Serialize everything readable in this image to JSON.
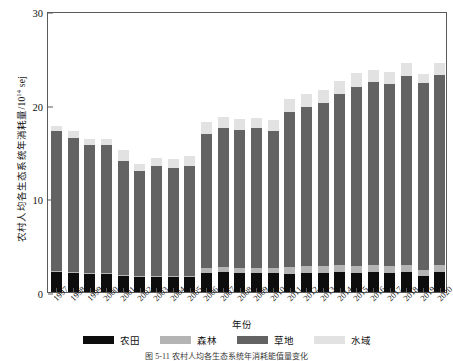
{
  "chart_data": {
    "type": "bar",
    "stacked": true,
    "title": "",
    "xlabel": "年份",
    "ylabel": "农村人均各生态系统年消耗量/10",
    "ylabel_exponent": "14",
    "ylabel_unit": " sej",
    "ylim": [
      0,
      30
    ],
    "yticks": [
      0,
      10,
      20,
      30
    ],
    "grid": false,
    "legend_position": "bottom",
    "categories": [
      "1997",
      "1998",
      "1999",
      "2000",
      "2001",
      "2002",
      "2003",
      "2004",
      "2005",
      "2006",
      "2007",
      "2008",
      "2009",
      "2010",
      "2011",
      "2012",
      "2013",
      "2014",
      "2015",
      "2016",
      "2017",
      "2018",
      "2019",
      "2020"
    ],
    "series": [
      {
        "name": "农田",
        "color": "#0d0d0d",
        "values": [
          2.1,
          2.0,
          1.9,
          1.9,
          1.7,
          1.6,
          1.6,
          1.6,
          1.6,
          2.0,
          2.1,
          2.0,
          2.0,
          2.0,
          1.9,
          2.0,
          2.0,
          2.1,
          2.0,
          2.1,
          2.0,
          2.1,
          1.7,
          2.1
        ]
      },
      {
        "name": "森林",
        "color": "#b4b4b4",
        "values": [
          0.15,
          0.15,
          0.15,
          0.15,
          0.15,
          0.15,
          0.15,
          0.15,
          0.15,
          0.55,
          0.6,
          0.6,
          0.6,
          0.6,
          0.75,
          0.8,
          0.8,
          0.8,
          0.8,
          0.8,
          0.8,
          0.8,
          0.7,
          0.8
        ]
      },
      {
        "name": "草地",
        "color": "#636363",
        "values": [
          14.9,
          14.3,
          13.6,
          13.6,
          12.1,
          11.2,
          11.7,
          11.5,
          11.7,
          14.3,
          14.8,
          14.7,
          14.9,
          14.6,
          16.6,
          17.0,
          17.4,
          18.2,
          19.1,
          19.5,
          19.4,
          20.2,
          19.9,
          20.3
        ]
      },
      {
        "name": "水域",
        "color": "#e2e2e2",
        "values": [
          0.55,
          0.75,
          0.65,
          0.65,
          1.25,
          0.75,
          0.85,
          0.95,
          1.05,
          1.35,
          1.2,
          1.2,
          1.1,
          1.2,
          1.35,
          1.3,
          1.35,
          1.4,
          1.45,
          1.3,
          1.3,
          1.35,
          0.95,
          1.3
        ]
      }
    ],
    "totals": [
      17.7,
      17.2,
      16.3,
      16.3,
      15.2,
      13.7,
      14.3,
      14.2,
      14.5,
      18.2,
      18.7,
      18.5,
      18.6,
      18.4,
      20.6,
      21.1,
      21.55,
      22.5,
      23.35,
      23.7,
      23.5,
      24.45,
      23.25,
      24.5
    ]
  },
  "legend": {
    "items": [
      {
        "label": "农田",
        "color": "#0d0d0d"
      },
      {
        "label": "森林",
        "color": "#b4b4b4"
      },
      {
        "label": "草地",
        "color": "#636363"
      },
      {
        "label": "水域",
        "color": "#e2e2e2"
      }
    ]
  },
  "caption": {
    "text": "图 5-11   农村人均各生态系统年消耗能值量变化"
  },
  "axis": {
    "y_title_prefix": "农村人均各生态系统年消耗量/10",
    "y_title_sup": "14",
    "y_title_suffix": " sej",
    "x_title": "年份"
  }
}
